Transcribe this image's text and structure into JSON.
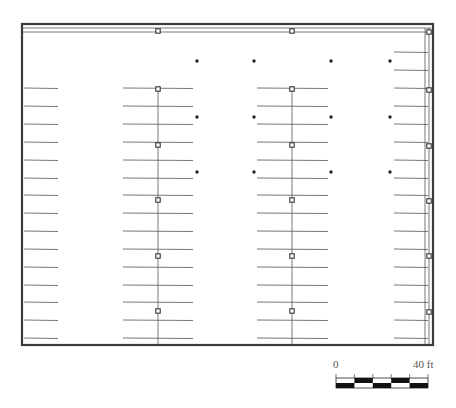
{
  "plan": {
    "type": "floor-plan",
    "subject": "parking stall layout",
    "colors": {
      "wall": "#3a3a3a",
      "line": "#555555",
      "column": "#333333",
      "dot": "#222222",
      "background": "#ffffff"
    },
    "border": {
      "x": 22,
      "y": 24,
      "w": 411,
      "h": 321
    },
    "top_band_y": [
      28,
      32
    ],
    "right_band_x": [
      425,
      429
    ],
    "column_lines_x": [
      158,
      292
    ],
    "columns": [
      {
        "x": 158,
        "y": 31
      },
      {
        "x": 292,
        "y": 31
      },
      {
        "x": 429,
        "y": 32
      },
      {
        "x": 158,
        "y": 89
      },
      {
        "x": 292,
        "y": 89
      },
      {
        "x": 429,
        "y": 90
      },
      {
        "x": 158,
        "y": 145
      },
      {
        "x": 292,
        "y": 145
      },
      {
        "x": 429,
        "y": 146
      },
      {
        "x": 158,
        "y": 200
      },
      {
        "x": 292,
        "y": 200
      },
      {
        "x": 429,
        "y": 201
      },
      {
        "x": 158,
        "y": 256
      },
      {
        "x": 292,
        "y": 256
      },
      {
        "x": 429,
        "y": 256
      },
      {
        "x": 158,
        "y": 311
      },
      {
        "x": 292,
        "y": 311
      },
      {
        "x": 429,
        "y": 312
      }
    ],
    "stall_rows_y": [
      88,
      106,
      124,
      142,
      160,
      178,
      195,
      213,
      231,
      249,
      267,
      285,
      302,
      320,
      338
    ],
    "right_stall_rows_y": [
      52,
      70,
      88,
      106,
      124,
      142,
      160,
      178,
      195,
      213,
      231,
      249,
      267,
      285,
      302,
      320,
      338
    ],
    "stall_groups": [
      {
        "x1": 24,
        "x2": 58,
        "rows": "stall_rows_y"
      },
      {
        "x1": 123,
        "x2": 193,
        "rows": "stall_rows_y"
      },
      {
        "x1": 257,
        "x2": 328,
        "rows": "stall_rows_y"
      },
      {
        "x1": 394,
        "x2": 428,
        "rows": "right_stall_rows_y"
      }
    ],
    "dots": [
      {
        "x": 197,
        "y": 61
      },
      {
        "x": 254,
        "y": 61
      },
      {
        "x": 331,
        "y": 61
      },
      {
        "x": 390,
        "y": 61
      },
      {
        "x": 197,
        "y": 117
      },
      {
        "x": 254,
        "y": 117
      },
      {
        "x": 331,
        "y": 117
      },
      {
        "x": 390,
        "y": 117
      },
      {
        "x": 197,
        "y": 172
      },
      {
        "x": 254,
        "y": 172
      },
      {
        "x": 331,
        "y": 172
      },
      {
        "x": 390,
        "y": 172
      }
    ]
  },
  "scale_bar": {
    "start_label": "0",
    "end_label": "40 ft",
    "segments": 5,
    "x": 336,
    "y": 378,
    "w": 92,
    "seg_h": 5
  }
}
